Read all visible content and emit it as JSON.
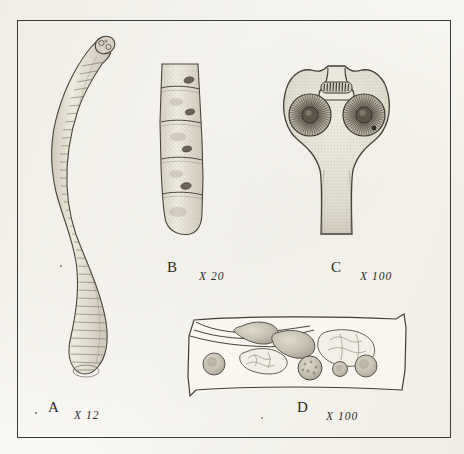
{
  "plate": {
    "title": "Cestode anatomy plate",
    "background_color": "#fcfbf7",
    "frame_color": "#3a3a38",
    "ink_color": "#3c3a35"
  },
  "figures": [
    {
      "id": "A",
      "letter": "A",
      "magnification": "X 12",
      "subject": "entire-worm-strobila",
      "description": "Whole sinuous segmented tapeworm with scolex at top and broad posterior proglottids"
    },
    {
      "id": "B",
      "letter": "B",
      "magnification": "X 20",
      "subject": "proglottid-chain",
      "description": "Chain of four mature proglottids with lateral genital pores"
    },
    {
      "id": "C",
      "letter": "C",
      "magnification": "X 100",
      "subject": "scolex",
      "description": "Scolex with two suckers and armed rostellum bearing a row of hooks"
    },
    {
      "id": "D",
      "letter": "D",
      "magnification": "X 100",
      "subject": "mature-proglottid",
      "description": "Mature proglottid showing testes, ovary, vitelline gland and uterus"
    }
  ]
}
